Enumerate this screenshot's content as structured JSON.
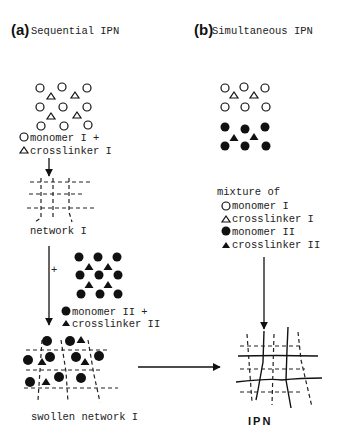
{
  "panel_a": {
    "letter": "(a)",
    "title": "Sequential IPN",
    "legend1": [
      {
        "symbol": "open-circle",
        "text": "monomer I +"
      },
      {
        "symbol": "open-triangle",
        "text": "crosslinker I"
      }
    ],
    "network_label": "network I",
    "plus_label": "+",
    "legend2": [
      {
        "symbol": "filled-circle",
        "text": "monomer II   +"
      },
      {
        "symbol": "filled-triangle",
        "text": "crosslinker II"
      }
    ],
    "swollen_label": "swollen network I"
  },
  "panel_b": {
    "letter": "(b)",
    "title": "Simultaneous IPN",
    "mixture_heading": "mixture of",
    "legend": [
      {
        "symbol": "open-circle",
        "text": "monomer I"
      },
      {
        "symbol": "open-triangle",
        "text": "crosslinker I"
      },
      {
        "symbol": "filled-circle",
        "text": "monomer II"
      },
      {
        "symbol": "filled-triangle",
        "text": "crosslinker II"
      }
    ],
    "result_label": "IPN"
  }
}
